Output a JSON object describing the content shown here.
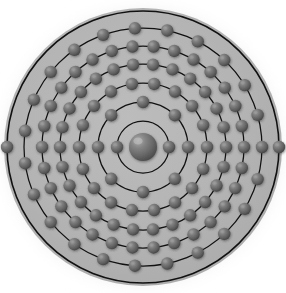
{
  "figure": {
    "kind": "bohr-atomic-model",
    "title": "Bohr model atom diagram",
    "background_color": "#ffffff",
    "disk_color": "#b3b3b3",
    "glow_color": "#c9c9c9",
    "shell_line_color": "#111111",
    "electron_color": "#6e6e6e",
    "electron_highlight_color": "#9a9a9a",
    "electron_shadow_color": "#3c3c3c",
    "nucleus_color": "#6b6b6b",
    "nucleus_highlight_color": "#a5a5a5",
    "center_x": 143,
    "center_y": 147,
    "disk_radius": 139
  },
  "nucleus": {
    "label": "nucleus",
    "radius": 14
  },
  "chart_data": {
    "type": "scatter",
    "title": "Bohr model atom diagram",
    "xlabel": "",
    "ylabel": "",
    "center": [
      143,
      147
    ],
    "electron_radius": 6.2,
    "shell_count": 7,
    "electron_total": 109,
    "electron_configuration": "2-8-18-32-32-15-2",
    "shells": [
      {
        "index": 1,
        "name": "K",
        "radius": 26,
        "electrons": 2,
        "start_angle": 0
      },
      {
        "index": 2,
        "name": "L",
        "radius": 45,
        "electrons": 8,
        "start_angle": 0
      },
      {
        "index": 3,
        "name": "M",
        "radius": 64,
        "electrons": 18,
        "start_angle": 0
      },
      {
        "index": 4,
        "name": "N",
        "radius": 83,
        "electrons": 26,
        "start_angle": 0
      },
      {
        "index": 5,
        "name": "O",
        "radius": 101,
        "electrons": 30,
        "start_angle": 0
      },
      {
        "index": 6,
        "name": "P",
        "radius": 119,
        "electrons": 23,
        "start_angle": 0
      },
      {
        "index": 7,
        "name": "Q",
        "radius": 136,
        "electrons": 2,
        "start_angle": 0
      }
    ]
  }
}
